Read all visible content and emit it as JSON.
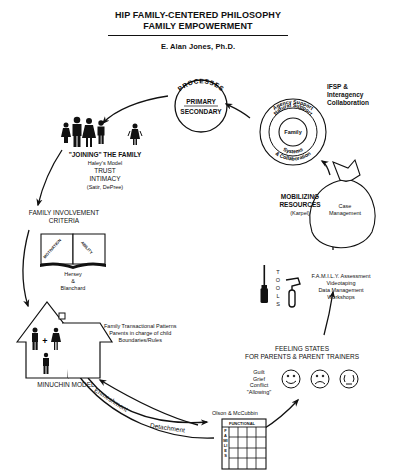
{
  "header": {
    "title_line1": "HIP FAMILY-CENTERED PHILOSOPHY",
    "title_line2": "FAMILY EMPOWERMENT",
    "author": "E. Alan Jones, Ph.D."
  },
  "processes": {
    "arc_label": "PROCESSES",
    "primary": "PRIMARY",
    "secondary": "SECONDARY"
  },
  "support_circles": {
    "outer_top": "Agency Support",
    "middle_top": "Natural Support",
    "center": "Family",
    "middle_bottom": "Systems",
    "outer_bottom": "& Collaboration",
    "side_label_1": "IFSP &",
    "side_label_2": "Interagency",
    "side_label_3": "Collaboration"
  },
  "joining": {
    "line1": "\"JOINING\" THE FAMILY",
    "line2": "Haley's Model",
    "line3": "TRUST",
    "line4": "INTIMACY",
    "line5": "(Satir, DePree)"
  },
  "involvement": {
    "line1": "FAMILY INVOLVEMENT",
    "line2": "CRITERIA",
    "book_left": "MOTIVATION",
    "book_right": "ABILITY",
    "credit1": "Hersey",
    "credit2": "&",
    "credit3": "Blanchard"
  },
  "minuchin": {
    "label": "MINUCHIN MODEL",
    "note1": "Family Transactional Patterns",
    "note2": "Parents in charge of child",
    "note3": "Boundaries/Rules"
  },
  "bottom_arrows": {
    "enmeshment": "Enmeshment",
    "detachment": "Detachment"
  },
  "olson": {
    "label": "Olson & McCubbin",
    "grid_header": "FUNCTIONAL",
    "grid_side": "FAMILIES"
  },
  "feeling_states": {
    "line1": "FEELING STATES",
    "line2": "FOR PARENTS & PARENT TRAINERS",
    "items": [
      "Guilt",
      "Grief",
      "Conflict",
      "\"Allowing\""
    ]
  },
  "tools": {
    "label": "TOOLS",
    "line1": "F.A.M.I.L.Y. Assessment",
    "line2": "Videotaping",
    "line3": "Data Management",
    "line4": "Workshops"
  },
  "mobilizing": {
    "line1": "MOBILIZING",
    "line2": "RESOURCES",
    "line3": "(Karpel)",
    "bag_line1": "Case",
    "bag_line2": "Management"
  }
}
